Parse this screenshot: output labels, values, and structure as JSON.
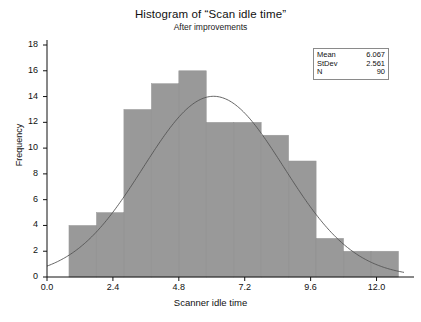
{
  "chart_data": {
    "type": "bar",
    "title": "Histogram of “Scan idle time”",
    "subtitle": "After improvements",
    "xlabel": "Scanner idle time",
    "ylabel": "Frequency",
    "xlim": [
      0.0,
      13.0
    ],
    "ylim": [
      0,
      18
    ],
    "grid": false,
    "bar_color": "#999999",
    "curve_color": "#555555",
    "bin_width": 1.0,
    "bin_starts": [
      0.8,
      1.8,
      2.8,
      3.8,
      4.8,
      5.8,
      6.8,
      7.8,
      8.8,
      9.8,
      10.8,
      11.8
    ],
    "categories": [
      "0.8-1.8",
      "1.8-2.8",
      "2.8-3.8",
      "3.8-4.8",
      "4.8-5.8",
      "5.8-6.8",
      "6.8-7.8",
      "7.8-8.8",
      "8.8-9.8",
      "9.8-10.8",
      "10.8-11.8",
      "11.8-12.8"
    ],
    "values": [
      4,
      5,
      13,
      15,
      16,
      12,
      12,
      11,
      9,
      3,
      2,
      2
    ],
    "xticks": [
      "0.0",
      "2.4",
      "4.8",
      "7.2",
      "9.6",
      "12.0"
    ],
    "xtick_values": [
      0.0,
      2.4,
      4.8,
      7.2,
      9.6,
      12.0
    ],
    "yticks": [
      "0",
      "2",
      "4",
      "6",
      "8",
      "10",
      "12",
      "14",
      "16",
      "18"
    ],
    "ytick_values": [
      0,
      2,
      4,
      6,
      8,
      10,
      12,
      14,
      16,
      18
    ],
    "overlay": {
      "name": "normal-fit-curve",
      "distribution": "normal",
      "mean": 6.067,
      "stdev": 2.561,
      "n": 90
    }
  },
  "legend": {
    "rows": [
      {
        "key": "Mean",
        "value": "6.067"
      },
      {
        "key": "StDev",
        "value": "2.561"
      },
      {
        "key": "N",
        "value": "90"
      }
    ]
  }
}
